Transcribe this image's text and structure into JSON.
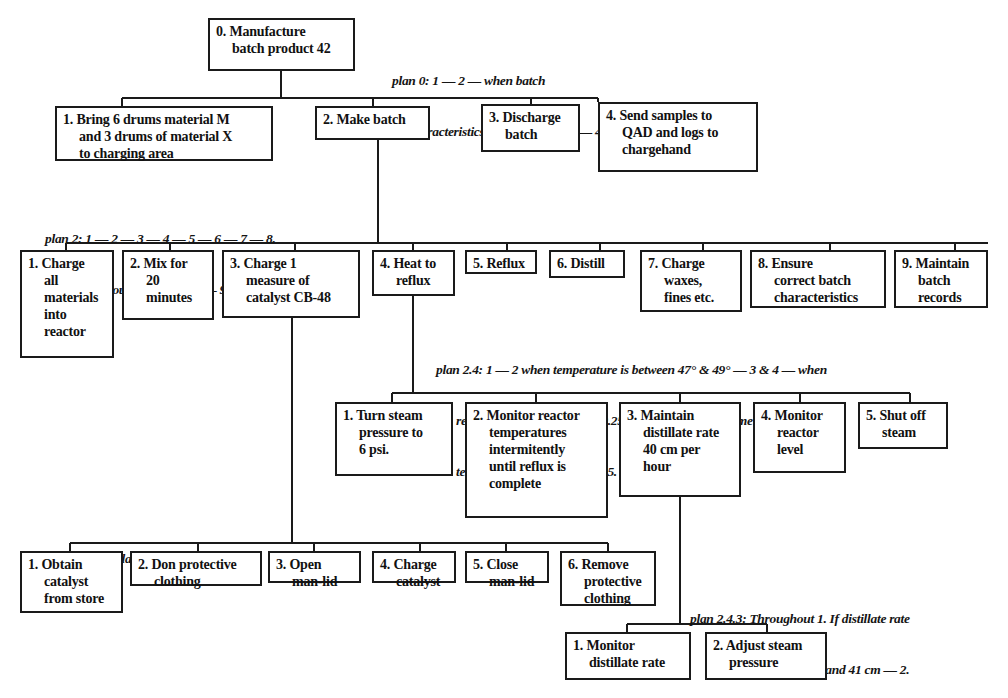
{
  "diagram": {
    "type": "hierarchical-task-analysis",
    "nodes": {
      "n0": {
        "label": "0. Manufacture\nbatch product 42"
      },
      "n1": {
        "label": "1. Bring 6 drums material M\nand 3 drums of material X\nto charging area"
      },
      "n2": {
        "label": "2. Make batch"
      },
      "n3": {
        "label": "3. Discharge\nbatch"
      },
      "n4": {
        "label": "4. Send samples to\nQAD and logs to\nchargehand"
      },
      "n2_1": {
        "label": "1. Charge\nall\nmaterials\ninto\nreactor"
      },
      "n2_2": {
        "label": "2. Mix for\n20\nminutes"
      },
      "n2_3": {
        "label": "3. Charge 1\nmeasure of\ncatalyst CB-48"
      },
      "n2_4": {
        "label": "4. Heat to\nreflux"
      },
      "n2_5": {
        "label": "5. Reflux"
      },
      "n2_6": {
        "label": "6. Distill"
      },
      "n2_7": {
        "label": "7. Charge\nwaxes,\nfines etc."
      },
      "n2_8": {
        "label": "8. Ensure\ncorrect batch\ncharacteristics"
      },
      "n2_9": {
        "label": "9. Maintain\nbatch\nrecords"
      },
      "n2_4_1": {
        "label": "1. Turn steam\npressure to\n6 psi."
      },
      "n2_4_2": {
        "label": "2. Monitor reactor\ntemperatures\nintermitently\nuntil reflux is\ncomplete"
      },
      "n2_4_3": {
        "label": "3. Maintain\ndistillate rate\n40 cm per\nhour"
      },
      "n2_4_4": {
        "label": "4. Monitor\nreactor\nlevel"
      },
      "n2_4_5": {
        "label": "5. Shut off\nsteam"
      },
      "n2_3_1": {
        "label": "1. Obtain\ncatalyst\nfrom store"
      },
      "n2_3_2": {
        "label": "2. Don protective\nclothing"
      },
      "n2_3_3": {
        "label": "3. Open\nman-lid"
      },
      "n2_3_4": {
        "label": "4. Charge\ncatalyst"
      },
      "n2_3_5": {
        "label": "5. Close\nman-lid"
      },
      "n2_3_6": {
        "label": "6. Remove\nprotective\nclothing"
      },
      "n2_4_3_1": {
        "label": "1. Monitor\ndistillate rate"
      },
      "n2_4_3_2": {
        "label": "2. Adjust steam\npressure"
      }
    },
    "plans": {
      "plan0": {
        "line1": "plan 0: 1 — 2 — when batch",
        "line2": "characteristics are reached — 3 — 4."
      },
      "plan2": {
        "line1": "plan 2: 1 — 2 — 3 — 4 — 5 — 6 — 7 — 8.",
        "line2": "Throughout, as prompted — 9."
      },
      "plan2_4": {
        "line1": "plan 2.4: 1 — 2 when temperature is between 47° & 49° — 3 & 4 — when",
        "line2": "reactor level reaches below 0.25 mtrs — 5. If at any time reactor",
        "line3": "temperature exceeds 53° —  5."
      },
      "plan2_3": {
        "line1": "plan 2.3: In order 1 to 6."
      },
      "plan2_4_3": {
        "line1": "plan 2.4.3: Throughout 1. If distillate rate",
        "line2": "goes outside limits 39 and 41 cm — 2."
      }
    },
    "colors": {
      "ink": "#1a1a1a",
      "paper": "#ffffff"
    }
  }
}
